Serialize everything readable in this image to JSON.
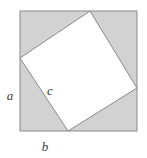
{
  "figure": {
    "name": "pythagorean-tilted-square",
    "canvas": {
      "width": 147,
      "height": 158,
      "background": "#ffffff"
    },
    "outer_square": {
      "label": "outer-square",
      "x": 20,
      "y": 11,
      "width": 117,
      "height": 120,
      "fill": "#d2d2d2",
      "stroke": "#8a8a8a",
      "stroke_width": 1
    },
    "inner_square": {
      "label": "inner-tilted-square",
      "points": "90,11 137,88 68,131 20,58",
      "fill": "#ffffff",
      "stroke": "#8a8a8a",
      "stroke_width": 1,
      "vertices": [
        {
          "name": "top-vertex",
          "x": 90,
          "y": 11
        },
        {
          "name": "right-vertex",
          "x": 137,
          "y": 88
        },
        {
          "name": "bottom-vertex",
          "x": 68,
          "y": 131
        },
        {
          "name": "left-vertex",
          "x": 20,
          "y": 58
        }
      ]
    },
    "labels": [
      {
        "name": "label-a",
        "text": "a",
        "x": 10,
        "y": 100,
        "anchor": "middle"
      },
      {
        "name": "label-b",
        "text": "b",
        "x": 45,
        "y": 151,
        "anchor": "middle"
      },
      {
        "name": "label-c",
        "text": "c",
        "x": 50,
        "y": 95,
        "anchor": "middle"
      }
    ],
    "colors": {
      "shaded_region": "#d2d2d2",
      "inner_region": "#ffffff",
      "line": "#8a8a8a",
      "text": "#3a3a3a"
    }
  }
}
